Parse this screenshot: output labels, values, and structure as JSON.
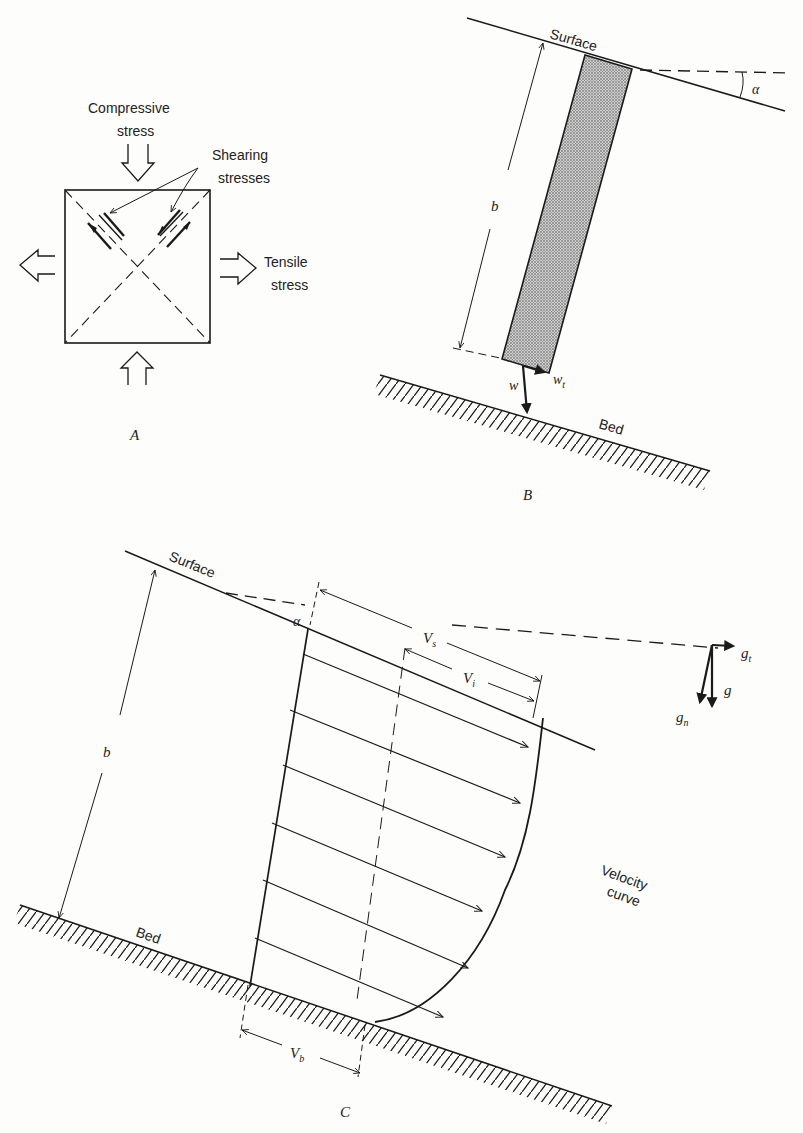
{
  "panel_a": {
    "label": "A",
    "compressive_line1": "Compressive",
    "compressive_line2": "stress",
    "shearing_line1": "Shearing",
    "shearing_line2": "stresses",
    "tensile_line1": "Tensile",
    "tensile_line2": "stress"
  },
  "panel_b": {
    "label": "B",
    "surface": "Surface",
    "bed": "Bed",
    "angle": "α",
    "thickness": "b",
    "weight": "w",
    "weight_tangential": "w",
    "weight_tangential_sub": "t"
  },
  "panel_c": {
    "label": "C",
    "surface": "Surface",
    "bed": "Bed",
    "angle": "α",
    "thickness": "b",
    "vs": "V",
    "vs_sub": "s",
    "vi": "V",
    "vi_sub": "i",
    "vb": "V",
    "vb_sub": "b",
    "g": "g",
    "gt": "g",
    "gt_sub": "t",
    "gn": "g",
    "gn_sub": "n",
    "velocity_line1": "Velocity",
    "velocity_line2": "curve"
  },
  "colors": {
    "ink": "#1a1a1a",
    "paper": "#fdfdfb",
    "stipple": "#8a8a8a"
  }
}
